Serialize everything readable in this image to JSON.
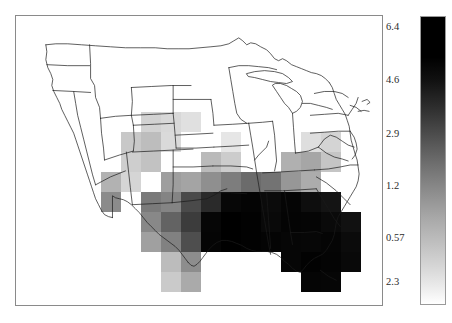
{
  "figure": {
    "kind": "gridded-choropleth-map",
    "region": "Contiguous United States",
    "map_border_color": "#8a8a8a",
    "state_outline_color": "#1a1a1a",
    "background_color": "#ffffff"
  },
  "colorbar": {
    "name": "grayscale-colorbar",
    "orientation": "vertical",
    "high_color": "#000000",
    "low_color": "#ffffff",
    "scale": "logarithmic",
    "ticks": [
      {
        "label": "6.4",
        "value": 6.4,
        "pos_pct": 3.7
      },
      {
        "label": "4.6",
        "value": 4.6,
        "pos_pct": 22.3
      },
      {
        "label": "2.9",
        "value": 2.9,
        "pos_pct": 40.9
      },
      {
        "label": "1.2",
        "value": 1.2,
        "pos_pct": 58.8
      },
      {
        "label": "0.57",
        "value": 0.57,
        "pos_pct": 76.8
      },
      {
        "label": "2.3",
        "value": 0.23,
        "pos_pct": 92.0
      }
    ]
  },
  "chart_data": {
    "type": "heatmap",
    "title": "",
    "xlabel": "",
    "ylabel": "",
    "colorbar_label": "",
    "grid": false,
    "legend_position": "right",
    "cell_size_px": 20,
    "colormap": "gray_reversed",
    "value_range": [
      0.23,
      6.4
    ],
    "ticks": [
      6.4,
      4.6,
      2.9,
      1.2,
      0.57,
      0.23
    ],
    "note": "Shaded grid cells over the central, southern and southeastern United States; darkest (highest) values across the Gulf Coast states and Florida.",
    "cells": [
      {
        "x": 141,
        "y": 112,
        "v": 0.55,
        "shade": "#d2d2d2"
      },
      {
        "x": 161,
        "y": 112,
        "v": 0.5,
        "shade": "#d8d8d8"
      },
      {
        "x": 181,
        "y": 112,
        "v": 0.42,
        "shade": "#e0e0e0"
      },
      {
        "x": 121,
        "y": 132,
        "v": 0.62,
        "shade": "#c8c8c8"
      },
      {
        "x": 141,
        "y": 132,
        "v": 0.7,
        "shade": "#bdbdbd"
      },
      {
        "x": 161,
        "y": 132,
        "v": 0.48,
        "shade": "#dadada"
      },
      {
        "x": 221,
        "y": 132,
        "v": 0.38,
        "shade": "#e6e6e6"
      },
      {
        "x": 301,
        "y": 132,
        "v": 0.45,
        "shade": "#dedede"
      },
      {
        "x": 321,
        "y": 132,
        "v": 0.52,
        "shade": "#d4d4d4"
      },
      {
        "x": 121,
        "y": 152,
        "v": 0.58,
        "shade": "#cecece"
      },
      {
        "x": 141,
        "y": 152,
        "v": 0.66,
        "shade": "#c2c2c2"
      },
      {
        "x": 201,
        "y": 152,
        "v": 0.72,
        "shade": "#bababa"
      },
      {
        "x": 221,
        "y": 152,
        "v": 0.6,
        "shade": "#cccccc"
      },
      {
        "x": 281,
        "y": 152,
        "v": 0.8,
        "shade": "#b0b0b0"
      },
      {
        "x": 301,
        "y": 152,
        "v": 0.88,
        "shade": "#a6a6a6"
      },
      {
        "x": 321,
        "y": 152,
        "v": 0.64,
        "shade": "#c5c5c5"
      },
      {
        "x": 101,
        "y": 172,
        "v": 0.8,
        "shade": "#b2b2b2"
      },
      {
        "x": 121,
        "y": 172,
        "v": 0.52,
        "shade": "#d5d5d5"
      },
      {
        "x": 161,
        "y": 172,
        "v": 0.95,
        "shade": "#9e9e9e"
      },
      {
        "x": 181,
        "y": 172,
        "v": 0.9,
        "shade": "#a4a4a4"
      },
      {
        "x": 201,
        "y": 172,
        "v": 1.05,
        "shade": "#8f8f8f"
      },
      {
        "x": 221,
        "y": 172,
        "v": 1.3,
        "shade": "#7d7d7d"
      },
      {
        "x": 241,
        "y": 172,
        "v": 1.55,
        "shade": "#6b6b6b"
      },
      {
        "x": 261,
        "y": 172,
        "v": 1.45,
        "shade": "#737373"
      },
      {
        "x": 281,
        "y": 172,
        "v": 1.0,
        "shade": "#979797"
      },
      {
        "x": 301,
        "y": 172,
        "v": 0.82,
        "shade": "#acacac"
      },
      {
        "x": 101,
        "y": 192,
        "v": 1.1,
        "shade": "#8b8b8b"
      },
      {
        "x": 141,
        "y": 192,
        "v": 1.35,
        "shade": "#7a7a7a"
      },
      {
        "x": 161,
        "y": 192,
        "v": 1.2,
        "shade": "#848484"
      },
      {
        "x": 181,
        "y": 192,
        "v": 2.2,
        "shade": "#4a4a4a"
      },
      {
        "x": 201,
        "y": 192,
        "v": 3.4,
        "shade": "#2a2a2a"
      },
      {
        "x": 221,
        "y": 192,
        "v": 5.9,
        "shade": "#070707"
      },
      {
        "x": 241,
        "y": 192,
        "v": 6.2,
        "shade": "#040404"
      },
      {
        "x": 261,
        "y": 192,
        "v": 5.6,
        "shade": "#0b0b0b"
      },
      {
        "x": 281,
        "y": 192,
        "v": 6.1,
        "shade": "#050505"
      },
      {
        "x": 301,
        "y": 192,
        "v": 5.4,
        "shade": "#0e0e0e"
      },
      {
        "x": 321,
        "y": 192,
        "v": 5.0,
        "shade": "#141414"
      },
      {
        "x": 141,
        "y": 212,
        "v": 1.15,
        "shade": "#888888"
      },
      {
        "x": 161,
        "y": 212,
        "v": 1.7,
        "shade": "#636363"
      },
      {
        "x": 181,
        "y": 212,
        "v": 2.6,
        "shade": "#3c3c3c"
      },
      {
        "x": 201,
        "y": 212,
        "v": 6.0,
        "shade": "#060606"
      },
      {
        "x": 221,
        "y": 212,
        "v": 6.4,
        "shade": "#000000"
      },
      {
        "x": 241,
        "y": 212,
        "v": 6.3,
        "shade": "#020202"
      },
      {
        "x": 261,
        "y": 212,
        "v": 5.8,
        "shade": "#090909"
      },
      {
        "x": 281,
        "y": 212,
        "v": 6.2,
        "shade": "#040404"
      },
      {
        "x": 301,
        "y": 212,
        "v": 6.1,
        "shade": "#050505"
      },
      {
        "x": 321,
        "y": 212,
        "v": 5.7,
        "shade": "#0a0a0a"
      },
      {
        "x": 341,
        "y": 212,
        "v": 5.2,
        "shade": "#111111"
      },
      {
        "x": 141,
        "y": 232,
        "v": 0.95,
        "shade": "#a0a0a0"
      },
      {
        "x": 161,
        "y": 232,
        "v": 1.25,
        "shade": "#818181"
      },
      {
        "x": 181,
        "y": 232,
        "v": 2.1,
        "shade": "#4e4e4e"
      },
      {
        "x": 201,
        "y": 232,
        "v": 6.1,
        "shade": "#050505"
      },
      {
        "x": 221,
        "y": 232,
        "v": 6.4,
        "shade": "#000000"
      },
      {
        "x": 241,
        "y": 232,
        "v": 6.3,
        "shade": "#020202"
      },
      {
        "x": 261,
        "y": 232,
        "v": 6.2,
        "shade": "#040404"
      },
      {
        "x": 281,
        "y": 232,
        "v": 6.0,
        "shade": "#060606"
      },
      {
        "x": 301,
        "y": 232,
        "v": 5.9,
        "shade": "#070707"
      },
      {
        "x": 321,
        "y": 232,
        "v": 6.1,
        "shade": "#050505"
      },
      {
        "x": 341,
        "y": 232,
        "v": 5.6,
        "shade": "#0b0b0b"
      },
      {
        "x": 161,
        "y": 252,
        "v": 0.72,
        "shade": "#bcbcbc"
      },
      {
        "x": 181,
        "y": 252,
        "v": 1.1,
        "shade": "#8d8d8d"
      },
      {
        "x": 281,
        "y": 252,
        "v": 6.0,
        "shade": "#060606"
      },
      {
        "x": 301,
        "y": 252,
        "v": 6.3,
        "shade": "#020202"
      },
      {
        "x": 321,
        "y": 252,
        "v": 6.2,
        "shade": "#040404"
      },
      {
        "x": 341,
        "y": 252,
        "v": 5.8,
        "shade": "#090909"
      },
      {
        "x": 161,
        "y": 272,
        "v": 0.6,
        "shade": "#cacaca"
      },
      {
        "x": 181,
        "y": 272,
        "v": 0.85,
        "shade": "#aaaaaa"
      },
      {
        "x": 301,
        "y": 272,
        "v": 6.1,
        "shade": "#050505"
      },
      {
        "x": 321,
        "y": 272,
        "v": 6.0,
        "shade": "#060606"
      }
    ]
  }
}
